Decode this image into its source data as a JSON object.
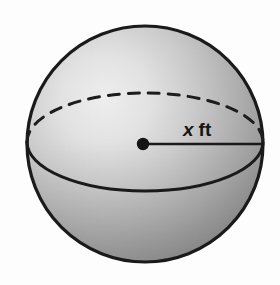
{
  "figure": {
    "kind": "solid-geometry-diagram",
    "shape_name": "sphere",
    "background_color": "#fdfdfd",
    "outline_color": "#1a1a1a",
    "fill_light": "#e9e9e9",
    "fill_mid": "#b5b5b5",
    "fill_dark": "#8a8a8a",
    "fill_darkest": "#767676"
  },
  "labels": {
    "radius_variable": "x",
    "radius_unit": "ft",
    "radius_full": "x ft"
  },
  "geometry": {
    "sphere": {
      "center_x": 145,
      "center_y": 144,
      "radius": 118,
      "left_x": 27,
      "right_x": 263,
      "top_y": 27,
      "bottom_y": 262
    },
    "equator_ellipse": {
      "center_x": 145,
      "center_y": 142,
      "radius_x": 118,
      "radius_y": 48,
      "back_arc_style": "dashed",
      "front_arc_style": "solid"
    },
    "radius_segment": {
      "from_x": 143,
      "from_y": 144,
      "to_x": 262,
      "to_y": 144
    },
    "center_dot": {
      "x": 143,
      "y": 144,
      "r": 6
    },
    "label_position": {
      "x": 183,
      "y": 135
    }
  },
  "highlight": {
    "center_x": 105,
    "center_y": 100,
    "color": "#ededed"
  }
}
